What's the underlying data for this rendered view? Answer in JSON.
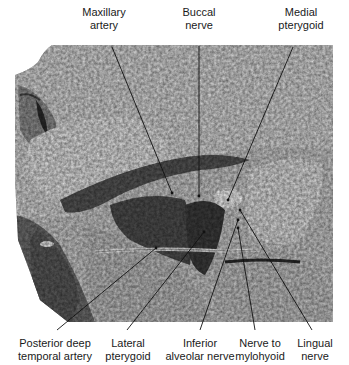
{
  "figure": {
    "labels": [
      {
        "id": "maxillary-artery",
        "lines": [
          "Maxillary",
          "artery"
        ],
        "x": 104,
        "y": 6,
        "target": [
          172,
          193
        ],
        "anchor": [
          112,
          47
        ]
      },
      {
        "id": "buccal-nerve",
        "lines": [
          "Buccal",
          "nerve"
        ],
        "x": 199,
        "y": 6,
        "target": [
          199,
          196
        ],
        "anchor": [
          199,
          46
        ]
      },
      {
        "id": "medial-pterygoid",
        "lines": [
          "Medial",
          "pterygoid"
        ],
        "x": 301,
        "y": 6,
        "target": [
          228,
          200
        ],
        "anchor": [
          293,
          47
        ]
      },
      {
        "id": "posterior-deep-temporal-artery",
        "lines": [
          "Posterior deep",
          "temporal artery"
        ],
        "x": 54,
        "y": 337,
        "target": [
          156,
          248
        ],
        "anchor": [
          57,
          330
        ]
      },
      {
        "id": "lateral-pterygoid",
        "lines": [
          "Lateral",
          "pterygoid"
        ],
        "x": 127,
        "y": 337,
        "target": [
          204,
          232
        ],
        "anchor": [
          127,
          330
        ]
      },
      {
        "id": "inferior-alveolar-nerve",
        "lines": [
          "Inferior",
          "alveolar nerve"
        ],
        "x": 200,
        "y": 337,
        "target": [
          238,
          220
        ],
        "anchor": [
          200,
          330
        ]
      },
      {
        "id": "nerve-to-mylohyoid",
        "lines": [
          "Nerve to",
          "mylohyoid"
        ],
        "x": 260,
        "y": 337,
        "target": [
          238,
          228
        ],
        "anchor": [
          255,
          330
        ]
      },
      {
        "id": "lingual-nerve",
        "lines": [
          "Lingual",
          "nerve"
        ],
        "x": 314,
        "y": 337,
        "target": [
          240,
          210
        ],
        "anchor": [
          312,
          330
        ]
      }
    ]
  },
  "colors": {
    "background": "#ffffff",
    "leader_line": "#111111",
    "label_text": "#1a1a1a"
  }
}
